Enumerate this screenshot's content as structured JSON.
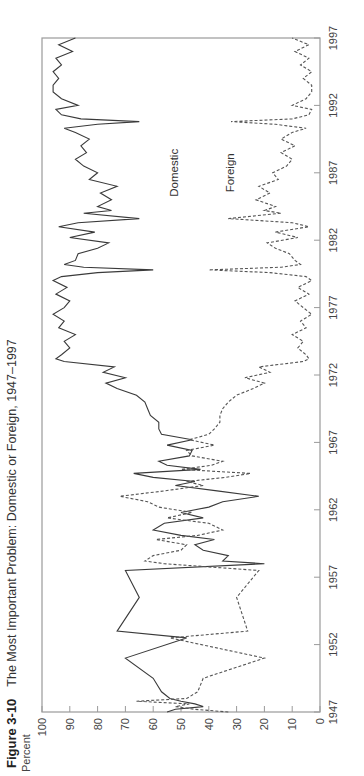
{
  "figure": {
    "number": "Figure 3-10",
    "title": "The Most Important Problem: Domestic or Foreign, 1947–1997",
    "ylabel": "Percent"
  },
  "chart_data": {
    "type": "line",
    "title": "The Most Important Problem: Domestic or Foreign, 1947–1997",
    "xlabel": "",
    "ylabel": "Percent",
    "xlim": [
      1947,
      1997
    ],
    "ylim": [
      0,
      100
    ],
    "xticks": [
      1947,
      1952,
      1957,
      1962,
      1967,
      1972,
      1977,
      1982,
      1987,
      1992,
      1997
    ],
    "yticks": [
      0,
      10,
      20,
      30,
      40,
      50,
      60,
      70,
      80,
      90,
      100
    ],
    "grid": false,
    "legend": "inline labels",
    "orientation": "rotated 90° counter-clockwise",
    "series": [
      {
        "name": "Domestic",
        "style": "solid",
        "x": [
          1947.0,
          1947.2,
          1947.4,
          1947.6,
          1947.8,
          1948.0,
          1948.5,
          1949.5,
          1951.0,
          1952.5,
          1953.0,
          1955.5,
          1957.5,
          1958.0,
          1958.2,
          1958.6,
          1959.0,
          1959.4,
          1959.8,
          1960.1,
          1960.5,
          1961.0,
          1961.4,
          1961.8,
          1962.2,
          1962.6,
          1963.0,
          1963.4,
          1963.8,
          1964.1,
          1964.4,
          1964.7,
          1965.0,
          1965.3,
          1965.6,
          1966.0,
          1966.4,
          1966.8,
          1967.2,
          1967.6,
          1968.0,
          1968.5,
          1969.0,
          1969.5,
          1970.0,
          1970.5,
          1971.0,
          1971.4,
          1971.8,
          1972.2,
          1972.6,
          1973.0,
          1973.2,
          1973.5,
          1974.0,
          1974.5,
          1975.0,
          1975.5,
          1976.0,
          1976.5,
          1977.0,
          1977.5,
          1978.0,
          1978.5,
          1979.0,
          1979.3,
          1979.6,
          1979.8,
          1980.0,
          1980.2,
          1980.5,
          1981.0,
          1981.4,
          1981.8,
          1982.2,
          1982.6,
          1983.0,
          1983.3,
          1983.6,
          1984.0,
          1984.2,
          1984.5,
          1985.0,
          1985.5,
          1986.0,
          1986.5,
          1987.0,
          1987.5,
          1988.0,
          1988.5,
          1989.0,
          1989.5,
          1990.0,
          1990.3,
          1990.6,
          1990.8,
          1991.0,
          1991.3,
          1991.7,
          1992.0,
          1992.5,
          1993.0,
          1993.5,
          1994.0,
          1994.5,
          1995.0,
          1995.5,
          1996.0,
          1996.5,
          1997.0
        ],
        "values": [
          55,
          52,
          42,
          45,
          50,
          54,
          57,
          60,
          70,
          48,
          73,
          65,
          70,
          20,
          35,
          33,
          42,
          45,
          38,
          50,
          60,
          56,
          42,
          50,
          40,
          35,
          22,
          37,
          52,
          45,
          60,
          67,
          43,
          55,
          58,
          47,
          46,
          55,
          46,
          57,
          58,
          58,
          61,
          62,
          63,
          66,
          73,
          77,
          70,
          78,
          74,
          92,
          95,
          93,
          90,
          92,
          88,
          94,
          92,
          96,
          92,
          90,
          95,
          91,
          96,
          93,
          80,
          60,
          85,
          92,
          88,
          87,
          80,
          76,
          90,
          81,
          94,
          87,
          65,
          85,
          75,
          80,
          75,
          79,
          73,
          83,
          80,
          85,
          88,
          84,
          86,
          83,
          88,
          92,
          80,
          65,
          86,
          93,
          95,
          87,
          93,
          96,
          96,
          94,
          96,
          93,
          95,
          89,
          94,
          88
        ],
        "label_position": {
          "x": 1987,
          "y": 51
        }
      },
      {
        "name": "Foreign",
        "style": "dashed",
        "x": [
          1947.0,
          1947.2,
          1947.4,
          1947.6,
          1947.8,
          1948.0,
          1948.5,
          1949.5,
          1951.0,
          1952.5,
          1953.0,
          1955.5,
          1957.5,
          1958.0,
          1958.2,
          1958.6,
          1959.0,
          1959.4,
          1959.8,
          1960.1,
          1960.5,
          1961.0,
          1961.4,
          1961.8,
          1962.2,
          1962.6,
          1963.0,
          1963.4,
          1963.8,
          1964.1,
          1964.4,
          1964.7,
          1965.0,
          1965.3,
          1965.6,
          1966.0,
          1966.4,
          1966.8,
          1967.2,
          1967.6,
          1968.0,
          1968.5,
          1969.0,
          1969.5,
          1970.0,
          1970.5,
          1971.0,
          1971.4,
          1971.8,
          1972.2,
          1972.6,
          1973.0,
          1973.2,
          1973.5,
          1974.0,
          1974.5,
          1975.0,
          1975.5,
          1976.0,
          1976.5,
          1977.0,
          1977.5,
          1978.0,
          1978.5,
          1979.0,
          1979.3,
          1979.6,
          1979.8,
          1980.0,
          1980.2,
          1980.5,
          1981.0,
          1981.4,
          1981.8,
          1982.2,
          1982.6,
          1983.0,
          1983.3,
          1983.6,
          1984.0,
          1984.2,
          1984.5,
          1985.0,
          1985.5,
          1986.0,
          1986.5,
          1987.0,
          1987.5,
          1988.0,
          1988.5,
          1989.0,
          1989.5,
          1990.0,
          1990.3,
          1990.6,
          1990.8,
          1991.0,
          1991.3,
          1991.7,
          1992.0,
          1992.5,
          1993.0,
          1993.5,
          1994.0,
          1994.5,
          1995.0,
          1995.5,
          1996.0,
          1996.5,
          1997.0
        ],
        "values": [
          33,
          45,
          52,
          47,
          66,
          48,
          44,
          42,
          20,
          54,
          26,
          30,
          22,
          56,
          63,
          60,
          50,
          48,
          59,
          44,
          35,
          40,
          55,
          46,
          58,
          62,
          72,
          56,
          42,
          48,
          34,
          25,
          50,
          39,
          35,
          46,
          48,
          38,
          47,
          40,
          38,
          36,
          36,
          35,
          33,
          30,
          24,
          20,
          27,
          18,
          22,
          6,
          4,
          5,
          8,
          6,
          10,
          5,
          7,
          3,
          6,
          9,
          4,
          8,
          3,
          5,
          18,
          40,
          14,
          7,
          9,
          11,
          16,
          19,
          8,
          16,
          4,
          10,
          33,
          14,
          20,
          16,
          23,
          18,
          22,
          15,
          17,
          12,
          10,
          14,
          9,
          14,
          10,
          5,
          16,
          32,
          10,
          4,
          3,
          10,
          5,
          3,
          3,
          6,
          3,
          7,
          4,
          9,
          4,
          10
        ],
        "label_position": {
          "x": 1987,
          "y": 31
        }
      }
    ]
  }
}
